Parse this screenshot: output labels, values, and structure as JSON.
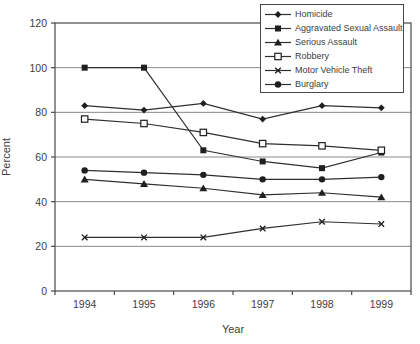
{
  "chart_data": {
    "type": "line",
    "title": "",
    "xlabel": "Year",
    "ylabel": "Percent",
    "x": [
      "1994",
      "1995",
      "1996",
      "1997",
      "1998",
      "1999"
    ],
    "ylim": [
      0,
      120
    ],
    "yticks": [
      0,
      20,
      40,
      60,
      80,
      100,
      120
    ],
    "grid": true,
    "legend_position": "top-right",
    "series": [
      {
        "name": "Homicide",
        "marker": "diamond",
        "values": [
          83,
          81,
          84,
          77,
          83,
          82
        ]
      },
      {
        "name": "Aggravated Sexual Assault",
        "marker": "square",
        "values": [
          100,
          100,
          63,
          58,
          55,
          62
        ]
      },
      {
        "name": "Serious Assault",
        "marker": "triangle",
        "values": [
          50,
          48,
          46,
          43,
          44,
          42
        ]
      },
      {
        "name": "Robbery",
        "marker": "square-open",
        "values": [
          77,
          75,
          71,
          66,
          65,
          63
        ]
      },
      {
        "name": "Motor Vehicle Theft",
        "marker": "x",
        "values": [
          24,
          24,
          24,
          28,
          31,
          30
        ]
      },
      {
        "name": "Burglary",
        "marker": "circle",
        "values": [
          54,
          53,
          52,
          50,
          50,
          51
        ]
      }
    ]
  },
  "colors": {
    "line": "#2f2f2f",
    "marker": "#1f1f1f",
    "grid": "#8a8a8a",
    "border": "#4a4a4a",
    "text": "#3d3d3d",
    "background": "#ffffff"
  }
}
